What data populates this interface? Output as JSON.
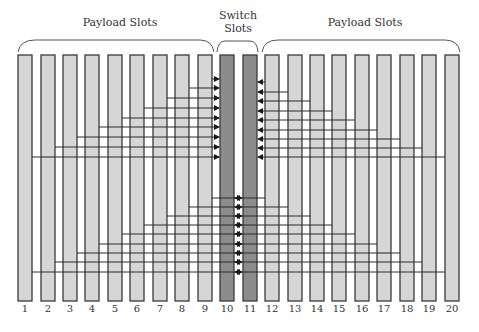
{
  "labels": {
    "payload_left": "Payload Slots",
    "switch": "Switch Slots",
    "switch_line1": "Switch",
    "switch_line2": "Slots",
    "payload_right": "Payload Slots"
  },
  "slot_numbers": [
    "1",
    "2",
    "3",
    "4",
    "5",
    "6",
    "7",
    "8",
    "9",
    "10",
    "11",
    "12",
    "13",
    "14",
    "15",
    "16",
    "17",
    "18",
    "19",
    "20"
  ],
  "colors": {
    "payload_fill": "#d6d6d6",
    "switch_fill": "#8c8c8c",
    "stroke": "#3a3a3a",
    "line": "#2a2a2a"
  },
  "slots": {
    "x_left": [
      18,
      41,
      63,
      85,
      108,
      130,
      153,
      175,
      198,
      220,
      243,
      265,
      288,
      310,
      332,
      355,
      377,
      400,
      422,
      445
    ],
    "width": 14,
    "top": 55,
    "bottom": 301,
    "switch_indices": [
      9,
      10
    ]
  },
  "connections": {
    "top_left_to_slot10": {
      "ys": [
        79,
        88,
        98,
        108,
        118,
        127,
        137,
        147,
        157
      ],
      "from_slots": [
        9,
        8,
        7,
        6,
        5,
        4,
        3,
        2,
        1
      ]
    },
    "top_right_to_slot11": {
      "ys": [
        82,
        92,
        101,
        111,
        120,
        130,
        139,
        148,
        157
      ],
      "from_slots": [
        12,
        13,
        14,
        15,
        16,
        17,
        18,
        19,
        20
      ]
    },
    "bottom_left_to_slot11": {
      "ys": [
        198,
        207,
        216,
        225,
        234,
        244,
        253,
        262,
        272
      ],
      "from_slots": [
        9,
        8,
        7,
        6,
        5,
        4,
        3,
        2,
        1
      ]
    },
    "bottom_right_to_slot10": {
      "ys": [
        198,
        207,
        216,
        225,
        234,
        244,
        253,
        262,
        272
      ],
      "from_slots": [
        12,
        13,
        14,
        15,
        16,
        17,
        18,
        19,
        20
      ]
    }
  }
}
